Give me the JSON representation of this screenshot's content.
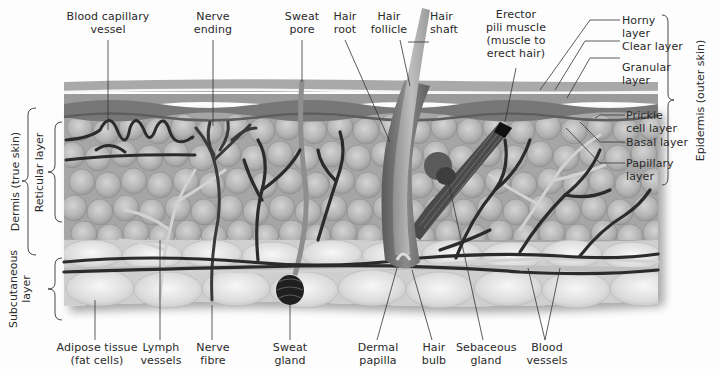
{
  "diagram": {
    "colors": {
      "background": "#fdfdfd",
      "horny_layer": "#a9a9a9",
      "clear_layer": "#f2f2f2",
      "granular_layer": "#8f8f8f",
      "prickle_layer": "#7a7a7a",
      "dermis_cells": "#b8b8b8",
      "subcutaneous_cells": "#d9d9d9",
      "vessels_dark": "#2b2b2b",
      "lymph_light": "#cfcfcf",
      "label_text": "#2a2a2a"
    },
    "top_labels": [
      {
        "id": "blood-capillary-vessel",
        "text": "Blood capillary\nvessel"
      },
      {
        "id": "nerve-ending",
        "text": "Nerve\nending"
      },
      {
        "id": "sweat-pore",
        "text": "Sweat\npore"
      },
      {
        "id": "hair-root",
        "text": "Hair\nroot"
      },
      {
        "id": "hair-follicle",
        "text": "Hair\nfollicle"
      },
      {
        "id": "hair-shaft",
        "text": "Hair\nshaft"
      },
      {
        "id": "erector-pili-muscle",
        "text": "Erector\npili muscle\n(muscle to\nerect hair)"
      }
    ],
    "right_labels": [
      {
        "id": "horny-layer",
        "text": "Horny\nlayer"
      },
      {
        "id": "clear-layer",
        "text": "Clear layer"
      },
      {
        "id": "granular-layer",
        "text": "Granular\nlayer"
      },
      {
        "id": "prickle-cell-layer",
        "text": "Prickle\ncell layer"
      },
      {
        "id": "basal-layer",
        "text": "Basal layer"
      },
      {
        "id": "papillary-layer",
        "text": "Papillary\nlayer"
      }
    ],
    "bottom_labels": [
      {
        "id": "adipose-tissue",
        "text": "Adipose tissue\n(fat cells)"
      },
      {
        "id": "lymph-vessels",
        "text": "Lymph\nvessels"
      },
      {
        "id": "nerve-fibre",
        "text": "Nerve\nfibre"
      },
      {
        "id": "sweat-gland",
        "text": "Sweat\ngland"
      },
      {
        "id": "dermal-papilla",
        "text": "Dermal\npapilla"
      },
      {
        "id": "hair-bulb",
        "text": "Hair\nbulb"
      },
      {
        "id": "sebaceous-gland",
        "text": "Sebaceous\ngland"
      },
      {
        "id": "blood-vessels",
        "text": "Blood\nvessels"
      }
    ],
    "brackets": {
      "epidermis": "Epidermis (outer skin)",
      "dermis": "Dermis (true skin)",
      "reticular": "Reticular layer",
      "subcutaneous": "Subcutaneous\nlayer"
    }
  }
}
